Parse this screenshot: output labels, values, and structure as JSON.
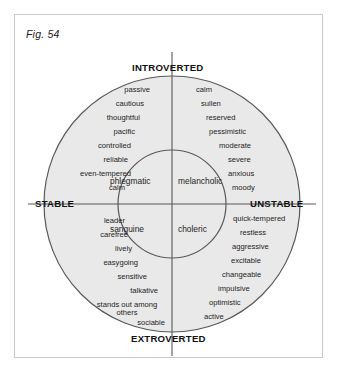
{
  "figure": {
    "caption": "Fig. 54",
    "colors": {
      "circle_fill": "#e9e9e9",
      "stroke": "#595959",
      "frame": "#c9c9cd",
      "text": "#1d1d1d"
    }
  },
  "axes": {
    "top": "INTROVERTED",
    "bottom": "EXTROVERTED",
    "left": "STABLE",
    "right": "UNSTABLE"
  },
  "quadrants": {
    "upper_left": "phlegmatic",
    "upper_right": "melancholic",
    "lower_left": "sanguine",
    "lower_right": "choleric"
  },
  "traits": {
    "phlegmatic": [
      "passive",
      "cautious",
      "thoughtful",
      "pacific",
      "controlled",
      "reliable",
      "even-tempered",
      "calm"
    ],
    "melancholic": [
      "calm",
      "sullen",
      "reserved",
      "pessimistic",
      "moderate",
      "severe",
      "anxious",
      "moody"
    ],
    "sanguine": [
      "leader",
      "carefree",
      "lively",
      "easygoing",
      "sensitive",
      "talkative",
      "stands out among",
      "others",
      "sociable"
    ],
    "choleric": [
      "quick-tempered",
      "restless",
      "aggressive",
      "excitable",
      "changeable",
      "impulsive",
      "optimistic",
      "active"
    ]
  }
}
